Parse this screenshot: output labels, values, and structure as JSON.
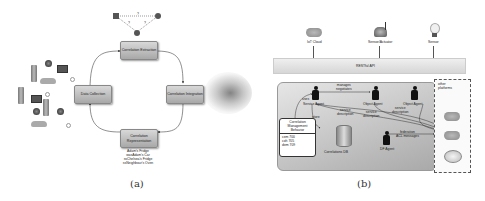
{
  "panel_a": {
    "caption": "(a)",
    "cycle_nodes": [
      {
        "id": "correlation-extraction",
        "label": "Correlation Extraction"
      },
      {
        "id": "correlation-integration",
        "label": "Correlation Integration"
      },
      {
        "id": "correlation-representation",
        "label": "Correlation Representation"
      },
      {
        "id": "data-collection",
        "label": "Data Collection"
      }
    ],
    "graph_labels": [
      "?",
      "?",
      "?"
    ],
    "representation_examples": [
      "Adam's Fridge",
      "wasAdam's Car",
      "ssChelsea's Fridge",
      "ssNeighbour's Oven"
    ]
  },
  "panel_b": {
    "caption": "(b)",
    "top_devices": [
      {
        "id": "iot-cloud",
        "label": "IoT Cloud"
      },
      {
        "id": "sensor-actuator",
        "label": "Sensor/Actuator"
      },
      {
        "id": "sensor",
        "label": "Sensor"
      }
    ],
    "api_bar_label": "RESTful API",
    "agents": [
      {
        "id": "service-agent",
        "label": "Service Agent"
      },
      {
        "id": "object-agent-1",
        "label": "Object Agent"
      },
      {
        "id": "object-agent-2",
        "label": "Object Agent"
      },
      {
        "id": "df-agent",
        "label": "DF Agent"
      }
    ],
    "edge_labels": {
      "manages_negotiates": [
        "manages",
        "negotiates"
      ],
      "uses": "uses",
      "store": "store",
      "service_description_1": [
        "service",
        "description"
      ],
      "service_description_2": [
        "service",
        "description"
      ],
      "service_description_3": [
        "service",
        "description"
      ],
      "federation": [
        "federation",
        "ACL messages"
      ]
    },
    "database_label": "Correlations DB",
    "cm_behaviour": {
      "title": [
        "Correlation",
        "Management",
        "Behavior"
      ],
      "items": [
        "cem 700",
        "coh 705",
        "dem 709"
      ]
    },
    "other_platforms_label": [
      "other",
      "platforms"
    ]
  }
}
